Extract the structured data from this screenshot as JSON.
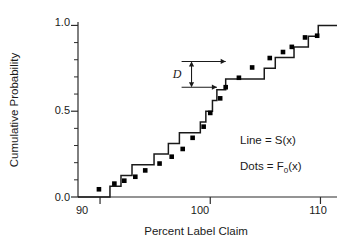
{
  "chart_data": {
    "type": "line",
    "title": "",
    "xlabel": "Percent Label Claim",
    "ylabel": "Cumulative Probability",
    "xlim": [
      88.0,
      111.5
    ],
    "ylim": [
      0.0,
      1.02
    ],
    "grid": false,
    "x_ticks_major": [
      90,
      100,
      110
    ],
    "x_tick_labels": [
      "90",
      "100",
      "110"
    ],
    "x_ticks_minor": [
      92,
      94,
      96,
      98,
      102,
      104,
      106,
      108
    ],
    "y_ticks_major": [
      0.0,
      0.5,
      1.0
    ],
    "y_tick_labels": [
      "0.0",
      "0.5",
      "1.0"
    ],
    "y_ticks_minor": [
      0.1,
      0.2,
      0.3,
      0.4,
      0.6,
      0.7,
      0.8,
      0.9
    ],
    "legend_position": "lower-right",
    "series": [
      {
        "name": "Line = S(x)",
        "type": "step",
        "style": "line",
        "color": "#1a1a1a",
        "comment": "empirical CDF, 16 observations, step height 0.0625",
        "x": [
          90.9,
          91.9,
          92.9,
          94.9,
          96.2,
          97.2,
          99.1,
          99.6,
          100.2,
          100.6,
          101.4,
          104.9,
          105.9,
          107.6,
          108.9,
          109.8
        ],
        "y": [
          0.0625,
          0.125,
          0.1875,
          0.25,
          0.3125,
          0.375,
          0.4375,
          0.5,
          0.5625,
          0.625,
          0.6875,
          0.75,
          0.8125,
          0.875,
          0.9375,
          1.0
        ],
        "x_start": 88.0,
        "x_end": 111.5
      },
      {
        "name": "Dots = F0(x)",
        "type": "scatter",
        "style": "dots",
        "color": "#000000",
        "marker": "square",
        "comment": "theoretical normal CDF evaluated at ordered observations",
        "x": [
          89.9,
          91.3,
          92.2,
          93.2,
          94.1,
          95.4,
          96.5,
          97.5,
          98.4,
          99.4,
          100.0,
          100.9,
          101.4,
          102.6,
          103.8,
          105.4,
          106.6,
          107.4,
          108.6,
          109.7
        ],
        "y": [
          0.045,
          0.078,
          0.095,
          0.118,
          0.155,
          0.195,
          0.235,
          0.28,
          0.345,
          0.41,
          0.49,
          0.575,
          0.64,
          0.695,
          0.755,
          0.81,
          0.845,
          0.875,
          0.93,
          0.94
        ]
      }
    ],
    "annotations": [
      {
        "name": "D",
        "label": "D",
        "type": "distance-marker",
        "description": "maximum vertical distance between S(x) and F0(x)",
        "upper_y": 0.79,
        "lower_y": 0.64,
        "x_left": 97.4,
        "x_right_upper": 101.4,
        "x_right_lower": 100.6,
        "arrow_x": 98.3,
        "label_x": 97.0,
        "label_y": 0.715
      }
    ],
    "legend_entries": [
      {
        "text_prefix": "Line = ",
        "symbol": "S(x)",
        "full": "Line = S(x)"
      },
      {
        "text_prefix": "Dots = ",
        "symbol": "F0(x)",
        "full": "Dots = F0(x)"
      }
    ]
  },
  "legend": {
    "line_label": "Line = S(x)",
    "dots_label_prefix": "Dots = F",
    "dots_label_sub": "0",
    "dots_label_suffix": "(x)"
  },
  "axes": {
    "x_title": "Percent Label Claim",
    "y_title": "Cumulative Probability",
    "x_labels": [
      "90",
      "100",
      "110"
    ],
    "y_labels": [
      "0.0",
      "0.5",
      "1.0"
    ]
  },
  "annotation": {
    "d_label": "D"
  }
}
